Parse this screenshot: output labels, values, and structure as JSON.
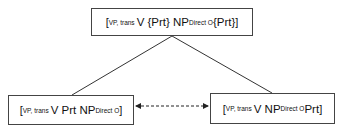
{
  "diagram": {
    "nodes": {
      "top": {
        "open": "[",
        "label_sub": "VP, trans",
        "t1": " V {Prt} NP",
        "obj_sub": "Direct O",
        "t2": " {Prt}",
        "close": "]"
      },
      "left": {
        "open": "[",
        "label_sub": "VP, trans",
        "t1": " V Prt NP",
        "obj_sub": "Direct O",
        "t2": "",
        "close": "]"
      },
      "right": {
        "open": "[",
        "label_sub": "VP, trans",
        "t1": " V NP",
        "obj_sub": "Direct O",
        "t2": " Prt",
        "close": "]"
      }
    },
    "edges": [
      {
        "from": "top",
        "to": "left",
        "style": "solid"
      },
      {
        "from": "top",
        "to": "right",
        "style": "solid"
      },
      {
        "from": "left",
        "to": "right",
        "style": "dashed",
        "arrows": "both"
      }
    ],
    "colors": {
      "line": "#333333",
      "border": "#444444"
    }
  }
}
